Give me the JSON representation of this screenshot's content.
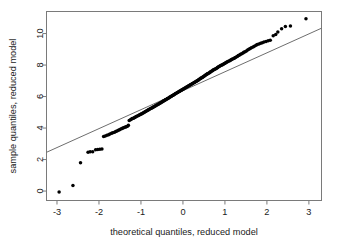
{
  "chart_data": {
    "type": "scatter",
    "title": "",
    "subtitle": "",
    "xlabel": "theoretical quantiles, reduced model",
    "ylabel": "sample quantiles, reduced model",
    "xlim": [
      -3.25,
      3.3
    ],
    "ylim": [
      -0.6,
      11.4
    ],
    "xticks": [
      -3,
      -2,
      -1,
      0,
      1,
      2,
      3
    ],
    "xticklabels": [
      "-3",
      "-2",
      "-1",
      "0",
      "1",
      "2",
      "3"
    ],
    "yticks": [
      0,
      2,
      4,
      6,
      8,
      10
    ],
    "yticklabels": [
      "0",
      "2",
      "4",
      "6",
      "8",
      "10"
    ],
    "grid": false,
    "legend": null,
    "point_color": "#000000",
    "line_color": "#6e6e6e",
    "frame_color": "#7a7a7a",
    "reference_line": {
      "name": "qq reference line",
      "x_start": -3.25,
      "y_start": 2.46,
      "x_end": 3.3,
      "y_end": 10.34,
      "slope": 1.203,
      "intercept": 6.37
    },
    "series": [
      {
        "name": "sample quantiles",
        "marker": "filled-circle",
        "points": [
          [
            -2.95,
            -0.06
          ],
          [
            -2.62,
            0.36
          ],
          [
            -2.44,
            1.79
          ],
          [
            -2.26,
            2.47
          ],
          [
            -2.21,
            2.49
          ],
          [
            -2.15,
            2.5
          ],
          [
            -2.08,
            2.62
          ],
          [
            -2.03,
            2.64
          ],
          [
            -1.98,
            2.66
          ],
          [
            -1.93,
            2.67
          ],
          [
            -1.89,
            3.46
          ],
          [
            -1.85,
            3.5
          ],
          [
            -1.81,
            3.54
          ],
          [
            -1.77,
            3.58
          ],
          [
            -1.74,
            3.62
          ],
          [
            -1.7,
            3.67
          ],
          [
            -1.67,
            3.7
          ],
          [
            -1.63,
            3.74
          ],
          [
            -1.6,
            3.78
          ],
          [
            -1.57,
            3.82
          ],
          [
            -1.54,
            3.86
          ],
          [
            -1.51,
            3.9
          ],
          [
            -1.48,
            3.94
          ],
          [
            -1.45,
            3.97
          ],
          [
            -1.43,
            4.0
          ],
          [
            -1.4,
            4.03
          ],
          [
            -1.37,
            4.06
          ],
          [
            -1.35,
            4.09
          ],
          [
            -1.32,
            4.12
          ],
          [
            -1.3,
            4.18
          ],
          [
            -1.28,
            4.48
          ],
          [
            -1.25,
            4.52
          ],
          [
            -1.23,
            4.56
          ],
          [
            -1.21,
            4.6
          ],
          [
            -1.18,
            4.63
          ],
          [
            -1.16,
            4.66
          ],
          [
            -1.14,
            4.69
          ],
          [
            -1.12,
            4.72
          ],
          [
            -1.1,
            4.75
          ],
          [
            -1.07,
            4.78
          ],
          [
            -1.05,
            4.81
          ],
          [
            -1.03,
            4.84
          ],
          [
            -1.01,
            4.87
          ],
          [
            -0.99,
            4.9
          ],
          [
            -0.97,
            4.93
          ],
          [
            -0.95,
            4.96
          ],
          [
            -0.93,
            4.99
          ],
          [
            -0.91,
            5.02
          ],
          [
            -0.89,
            5.05
          ],
          [
            -0.87,
            5.08
          ],
          [
            -0.85,
            5.11
          ],
          [
            -0.83,
            5.14
          ],
          [
            -0.82,
            5.16
          ],
          [
            -0.8,
            5.19
          ],
          [
            -0.78,
            5.22
          ],
          [
            -0.76,
            5.25
          ],
          [
            -0.74,
            5.28
          ],
          [
            -0.72,
            5.31
          ],
          [
            -0.71,
            5.33
          ],
          [
            -0.69,
            5.36
          ],
          [
            -0.67,
            5.39
          ],
          [
            -0.65,
            5.42
          ],
          [
            -0.64,
            5.44
          ],
          [
            -0.62,
            5.47
          ],
          [
            -0.6,
            5.5
          ],
          [
            -0.58,
            5.53
          ],
          [
            -0.57,
            5.55
          ],
          [
            -0.55,
            5.58
          ],
          [
            -0.53,
            5.61
          ],
          [
            -0.52,
            5.63
          ],
          [
            -0.5,
            5.66
          ],
          [
            -0.48,
            5.69
          ],
          [
            -0.47,
            5.71
          ],
          [
            -0.45,
            5.74
          ],
          [
            -0.43,
            5.77
          ],
          [
            -0.42,
            5.79
          ],
          [
            -0.4,
            5.82
          ],
          [
            -0.38,
            5.85
          ],
          [
            -0.37,
            5.87
          ],
          [
            -0.35,
            5.9
          ],
          [
            -0.33,
            5.93
          ],
          [
            -0.32,
            5.95
          ],
          [
            -0.3,
            5.98
          ],
          [
            -0.28,
            6.01
          ],
          [
            -0.27,
            6.03
          ],
          [
            -0.25,
            6.06
          ],
          [
            -0.23,
            6.09
          ],
          [
            -0.22,
            6.11
          ],
          [
            -0.2,
            6.14
          ],
          [
            -0.18,
            6.17
          ],
          [
            -0.17,
            6.19
          ],
          [
            -0.15,
            6.22
          ],
          [
            -0.13,
            6.25
          ],
          [
            -0.12,
            6.27
          ],
          [
            -0.1,
            6.3
          ],
          [
            -0.08,
            6.33
          ],
          [
            -0.07,
            6.35
          ],
          [
            -0.05,
            6.38
          ],
          [
            -0.03,
            6.41
          ],
          [
            -0.02,
            6.43
          ],
          [
            0.0,
            6.46
          ],
          [
            0.02,
            6.49
          ],
          [
            0.03,
            6.51
          ],
          [
            0.05,
            6.54
          ],
          [
            0.07,
            6.57
          ],
          [
            0.08,
            6.59
          ],
          [
            0.1,
            6.62
          ],
          [
            0.12,
            6.65
          ],
          [
            0.13,
            6.67
          ],
          [
            0.15,
            6.7
          ],
          [
            0.17,
            6.73
          ],
          [
            0.18,
            6.75
          ],
          [
            0.2,
            6.78
          ],
          [
            0.22,
            6.81
          ],
          [
            0.23,
            6.83
          ],
          [
            0.25,
            6.86
          ],
          [
            0.27,
            6.89
          ],
          [
            0.28,
            6.91
          ],
          [
            0.3,
            6.94
          ],
          [
            0.32,
            6.97
          ],
          [
            0.33,
            6.99
          ],
          [
            0.35,
            7.02
          ],
          [
            0.37,
            7.05
          ],
          [
            0.38,
            7.08
          ],
          [
            0.4,
            7.11
          ],
          [
            0.42,
            7.14
          ],
          [
            0.43,
            7.17
          ],
          [
            0.45,
            7.2
          ],
          [
            0.47,
            7.23
          ],
          [
            0.48,
            7.26
          ],
          [
            0.5,
            7.29
          ],
          [
            0.52,
            7.32
          ],
          [
            0.53,
            7.35
          ],
          [
            0.55,
            7.38
          ],
          [
            0.57,
            7.41
          ],
          [
            0.58,
            7.44
          ],
          [
            0.6,
            7.47
          ],
          [
            0.62,
            7.5
          ],
          [
            0.64,
            7.53
          ],
          [
            0.65,
            7.56
          ],
          [
            0.67,
            7.59
          ],
          [
            0.69,
            7.62
          ],
          [
            0.71,
            7.65
          ],
          [
            0.72,
            7.68
          ],
          [
            0.74,
            7.71
          ],
          [
            0.76,
            7.74
          ],
          [
            0.78,
            7.77
          ],
          [
            0.8,
            7.8
          ],
          [
            0.82,
            7.83
          ],
          [
            0.83,
            7.86
          ],
          [
            0.85,
            7.89
          ],
          [
            0.87,
            7.92
          ],
          [
            0.89,
            7.95
          ],
          [
            0.91,
            7.98
          ],
          [
            0.93,
            8.01
          ],
          [
            0.95,
            8.04
          ],
          [
            0.97,
            8.07
          ],
          [
            0.99,
            8.1
          ],
          [
            1.01,
            8.13
          ],
          [
            1.03,
            8.16
          ],
          [
            1.05,
            8.19
          ],
          [
            1.07,
            8.22
          ],
          [
            1.1,
            8.26
          ],
          [
            1.12,
            8.29
          ],
          [
            1.14,
            8.32
          ],
          [
            1.16,
            8.35
          ],
          [
            1.18,
            8.38
          ],
          [
            1.21,
            8.42
          ],
          [
            1.23,
            8.45
          ],
          [
            1.25,
            8.48
          ],
          [
            1.28,
            8.52
          ],
          [
            1.3,
            8.56
          ],
          [
            1.32,
            8.6
          ],
          [
            1.35,
            8.64
          ],
          [
            1.37,
            8.68
          ],
          [
            1.4,
            8.72
          ],
          [
            1.43,
            8.77
          ],
          [
            1.45,
            8.81
          ],
          [
            1.48,
            8.85
          ],
          [
            1.51,
            8.9
          ],
          [
            1.54,
            8.95
          ],
          [
            1.57,
            9.0
          ],
          [
            1.6,
            9.05
          ],
          [
            1.63,
            9.1
          ],
          [
            1.67,
            9.15
          ],
          [
            1.7,
            9.2
          ],
          [
            1.74,
            9.25
          ],
          [
            1.77,
            9.3
          ],
          [
            1.81,
            9.34
          ],
          [
            1.85,
            9.38
          ],
          [
            1.89,
            9.42
          ],
          [
            1.93,
            9.46
          ],
          [
            1.98,
            9.5
          ],
          [
            2.03,
            9.54
          ],
          [
            2.08,
            9.58
          ],
          [
            2.15,
            9.86
          ],
          [
            2.21,
            9.94
          ],
          [
            2.26,
            10.1
          ],
          [
            2.35,
            10.3
          ],
          [
            2.44,
            10.45
          ],
          [
            2.56,
            10.48
          ],
          [
            2.93,
            10.94
          ]
        ]
      }
    ]
  }
}
